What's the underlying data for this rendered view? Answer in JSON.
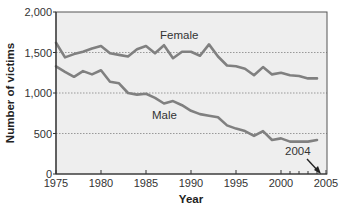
{
  "chart_data": {
    "type": "line",
    "title": "",
    "xlabel": "Year",
    "ylabel": "Number of victims",
    "xlim": [
      1975,
      2005
    ],
    "ylim": [
      0,
      2000
    ],
    "x_ticks": [
      1975,
      1980,
      1985,
      1990,
      1995,
      2000,
      2005
    ],
    "x_tick_labels": [
      "1975",
      "1980",
      "1985",
      "1990",
      "1995",
      "2000",
      "2005"
    ],
    "y_ticks": [
      0,
      500,
      1000,
      1500,
      2000
    ],
    "y_tick_labels": [
      "0",
      "500",
      "1,000",
      "1,500",
      "2,000"
    ],
    "grid": "horizontal dotted at 500, 1000, 1500",
    "legend": "inline labels",
    "x": [
      1975,
      1976,
      1977,
      1978,
      1979,
      1980,
      1981,
      1982,
      1983,
      1984,
      1985,
      1986,
      1987,
      1988,
      1989,
      1990,
      1991,
      1992,
      1993,
      1994,
      1995,
      1996,
      1997,
      1998,
      1999,
      2000,
      2001,
      2002,
      2003,
      2004
    ],
    "series": [
      {
        "name": "Female",
        "color": "#808080",
        "values": [
          1620,
          1440,
          1480,
          1510,
          1550,
          1580,
          1490,
          1470,
          1450,
          1540,
          1580,
          1490,
          1590,
          1430,
          1510,
          1510,
          1460,
          1600,
          1450,
          1340,
          1330,
          1300,
          1220,
          1320,
          1230,
          1250,
          1220,
          1210,
          1180,
          1180
        ]
      },
      {
        "name": "Male",
        "color": "#808080",
        "values": [
          1330,
          1260,
          1200,
          1270,
          1230,
          1280,
          1140,
          1120,
          1000,
          980,
          990,
          940,
          870,
          900,
          850,
          780,
          740,
          720,
          700,
          600,
          560,
          530,
          470,
          530,
          420,
          440,
          400,
          400,
          400,
          420
        ]
      }
    ],
    "annotations": [
      {
        "text": "2004",
        "arrow_to_year": 2004
      }
    ]
  },
  "labels": {
    "female": "Female",
    "male": "Male",
    "annotation": "2004",
    "xlabel": "Year",
    "ylabel": "Number of victims"
  },
  "colors": {
    "plot_bg": "#eeeeee",
    "line": "#808080",
    "axis": "#333333",
    "grid": "#999999"
  }
}
